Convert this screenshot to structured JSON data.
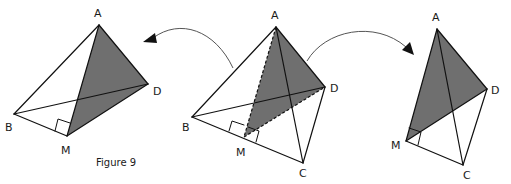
{
  "figure": {
    "caption": "Figure 9",
    "shade_color": "#6f6f6f",
    "line_color": "#111111",
    "arrow_color": "#555555"
  },
  "panels": {
    "left": {
      "description": "Half tetrahedron ABMD with shaded triangle AMD",
      "labels": {
        "A": "A",
        "B": "B",
        "M": "M",
        "D": "D"
      },
      "vertices": {
        "A": [
          99,
          25
        ],
        "B": [
          14,
          114
        ],
        "M": [
          67,
          136
        ],
        "D": [
          148,
          84
        ]
      },
      "shaded": [
        "A",
        "M",
        "D"
      ],
      "right_angle_at": "M"
    },
    "center": {
      "description": "Tetrahedron ABCD with midpoint M of BC and shaded section AMD",
      "labels": {
        "A": "A",
        "B": "B",
        "M": "M",
        "C": "C",
        "D": "D"
      },
      "vertices": {
        "A": [
          276,
          27
        ],
        "B": [
          192,
          117
        ],
        "M": [
          244,
          137
        ],
        "C": [
          303,
          163
        ],
        "D": [
          325,
          87
        ]
      },
      "shaded": [
        "A",
        "M",
        "D"
      ],
      "dashed_edges": [
        [
          "A",
          "M"
        ],
        [
          "M",
          "D"
        ]
      ],
      "right_angle_at": "M"
    },
    "right": {
      "description": "Half tetrahedron AMCD with shaded triangle AMD",
      "labels": {
        "A": "A",
        "M": "M",
        "C": "C",
        "D": "D"
      },
      "vertices": {
        "A": [
          437,
          29
        ],
        "M": [
          406,
          141
        ],
        "C": [
          463,
          165
        ],
        "D": [
          487,
          89
        ]
      },
      "shaded": [
        "A",
        "M",
        "D"
      ],
      "right_angle_at": "M"
    }
  },
  "arrows": [
    {
      "name": "arrow-to-left",
      "from": "center",
      "to": "left"
    },
    {
      "name": "arrow-to-right",
      "from": "center",
      "to": "right"
    }
  ]
}
